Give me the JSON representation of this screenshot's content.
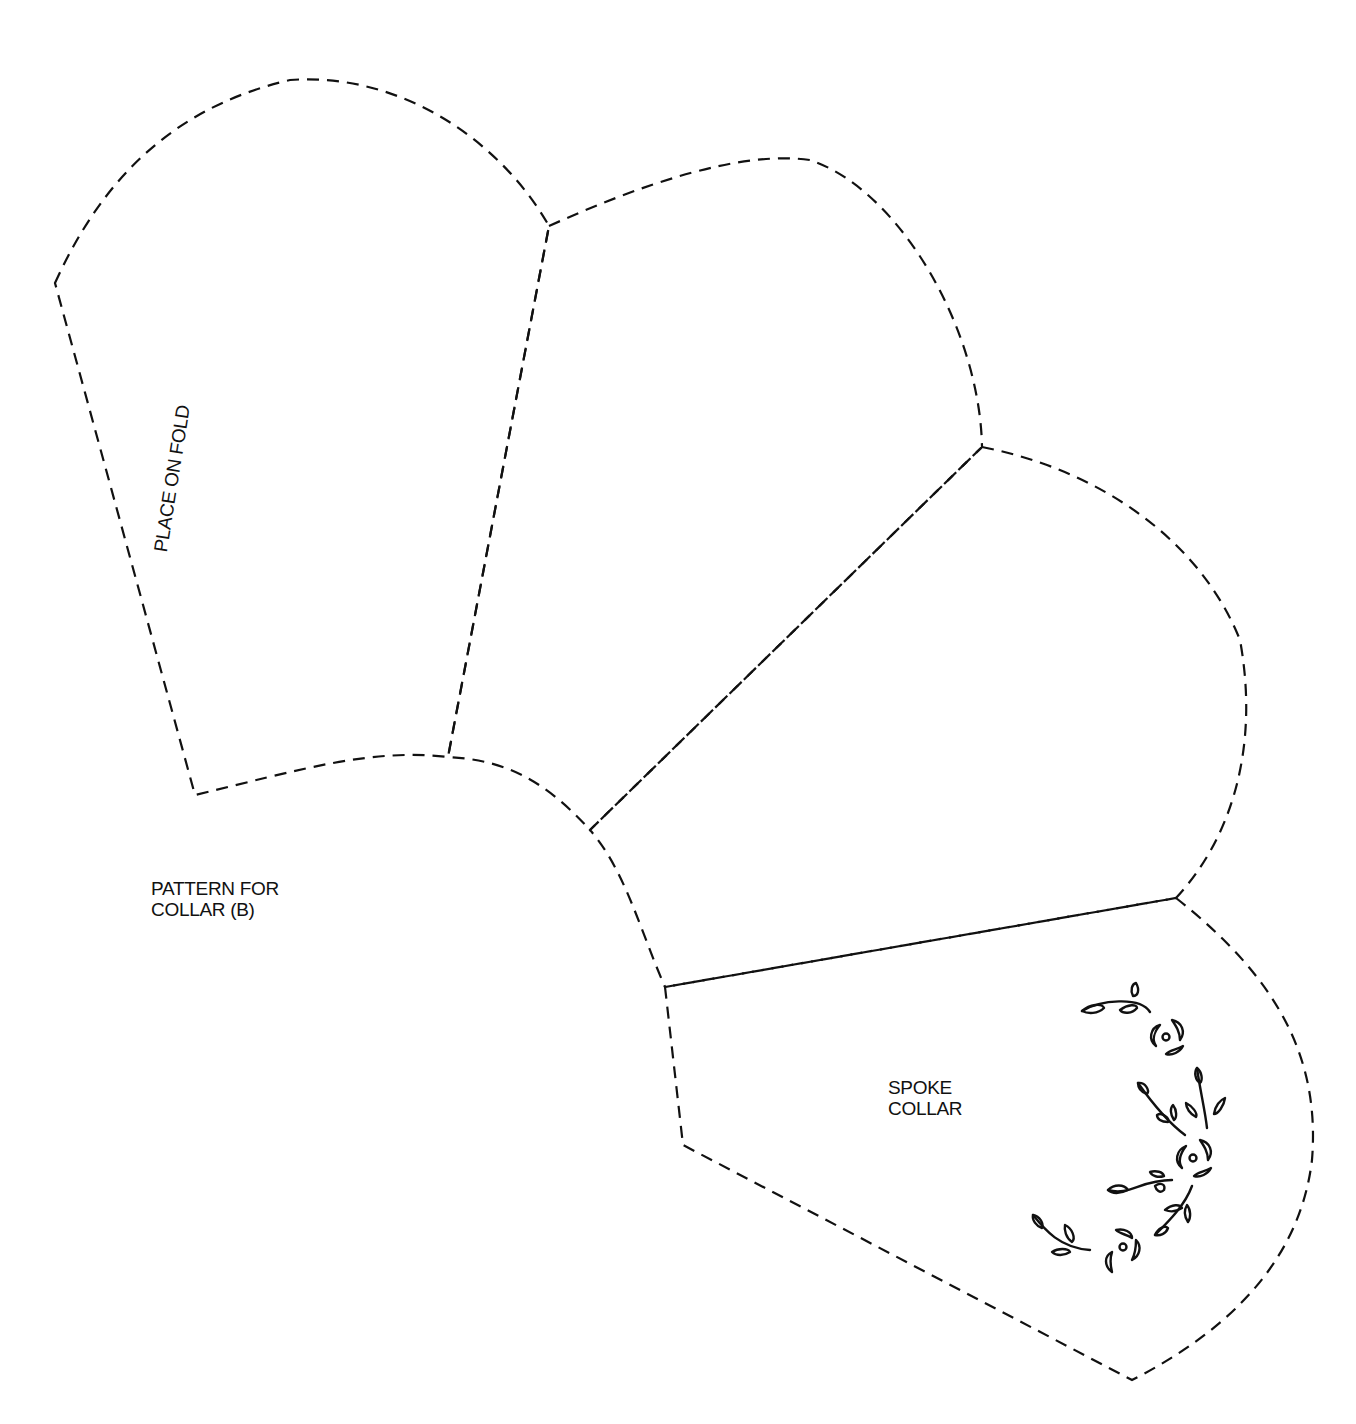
{
  "diagram": {
    "type": "sewing pattern",
    "line_style": "dashed cut lines",
    "colors": {
      "ink": "#111111",
      "paper": "#ffffff"
    }
  },
  "labels": {
    "fold": "PLACE ON FOLD",
    "title_line1": "PATTERN FOR",
    "title_line2": "COLLAR (B)",
    "spoke_line1": "SPOKE",
    "spoke_line2": "COLLAR"
  },
  "pieces": [
    {
      "name": "collar-panel-1",
      "note": "fold edge"
    },
    {
      "name": "collar-panel-2"
    },
    {
      "name": "collar-panel-3"
    },
    {
      "name": "collar-panel-4",
      "note": "embroidery motif"
    }
  ],
  "motif": {
    "name": "floral vine embroidery",
    "flowers": 3,
    "leaf_sprigs": 5
  }
}
